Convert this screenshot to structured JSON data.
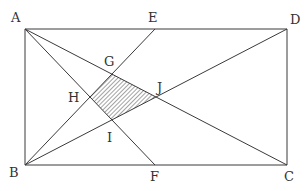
{
  "figure": {
    "type": "geometry",
    "colors": {
      "line": "#3a3a3a",
      "label": "#333333",
      "hatch": "#555555",
      "background": "#ffffff"
    },
    "points": {
      "A": {
        "label": "A",
        "x": 25,
        "y": 29
      },
      "D": {
        "label": "D",
        "x": 287,
        "y": 29
      },
      "C": {
        "label": "C",
        "x": 287,
        "y": 165
      },
      "B": {
        "label": "B",
        "x": 25,
        "y": 165
      },
      "E": {
        "label": "E",
        "x": 155,
        "y": 29
      },
      "F": {
        "label": "F",
        "x": 155,
        "y": 165
      },
      "G": {
        "label": "G",
        "x": 112,
        "y": 74
      },
      "H": {
        "label": "H",
        "x": 90,
        "y": 97
      },
      "I": {
        "label": "I",
        "x": 112,
        "y": 120
      },
      "J": {
        "label": "J",
        "x": 156,
        "y": 97
      }
    },
    "segments": [
      [
        "A",
        "D"
      ],
      [
        "D",
        "C"
      ],
      [
        "C",
        "B"
      ],
      [
        "B",
        "A"
      ],
      [
        "A",
        "C"
      ],
      [
        "B",
        "D"
      ],
      [
        "A",
        "F"
      ],
      [
        "B",
        "E"
      ]
    ],
    "shaded_region": [
      "G",
      "J",
      "I",
      "H"
    ]
  }
}
